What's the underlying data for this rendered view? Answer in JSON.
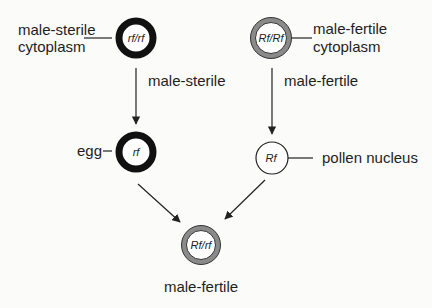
{
  "diagram": {
    "type": "genetics-cross",
    "nodes": [
      {
        "id": "ms-parent",
        "genotype": "rf/rf",
        "label_lines": [
          "male-sterile",
          "cytoplasm"
        ],
        "cytoplasm": "male-sterile"
      },
      {
        "id": "mf-parent",
        "genotype": "Rf/Rf",
        "label_lines": [
          "male-fertile",
          "cytoplasm"
        ],
        "cytoplasm": "male-fertile"
      },
      {
        "id": "egg",
        "genotype": "rf",
        "label": "egg"
      },
      {
        "id": "pollen",
        "genotype": "Rf",
        "label": "pollen nucleus"
      },
      {
        "id": "offspring",
        "genotype": "Rf/rf",
        "label": "male-fertile"
      }
    ],
    "edges": [
      {
        "from": "ms-parent",
        "to": "egg",
        "label": "male-sterile"
      },
      {
        "from": "mf-parent",
        "to": "pollen",
        "label": "male-fertile"
      },
      {
        "from": "egg",
        "to": "offspring",
        "label": ""
      },
      {
        "from": "pollen",
        "to": "offspring",
        "label": ""
      }
    ],
    "colors": {
      "male_sterile_ring": "#111111",
      "male_fertile_ring": "#8a8a8a",
      "line": "#222222",
      "background": "#fbfbf9"
    }
  }
}
